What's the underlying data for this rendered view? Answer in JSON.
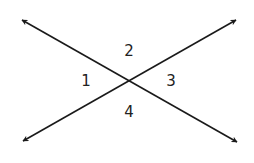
{
  "diagram": {
    "type": "intersecting-lines",
    "line_color": "#1a1a1a",
    "lines": [
      {
        "name": "line-a",
        "from": [
          22,
          20
        ],
        "to": [
          237,
          142
        ]
      },
      {
        "name": "line-b",
        "from": [
          23,
          141
        ],
        "to": [
          236,
          20
        ]
      }
    ],
    "intersection": [
      129,
      81
    ],
    "angles": [
      {
        "label": "1",
        "x": 86,
        "y": 81
      },
      {
        "label": "2",
        "x": 129,
        "y": 51
      },
      {
        "label": "3",
        "x": 171,
        "y": 81
      },
      {
        "label": "4",
        "x": 129,
        "y": 112
      }
    ]
  }
}
